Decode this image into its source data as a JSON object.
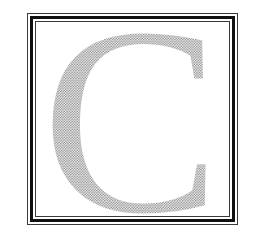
{
  "initial": {
    "letter": "C",
    "fill_style": "halftone-dots",
    "dot_color": "#8a8a8a",
    "background": "#ffffff"
  },
  "frame": {
    "style": "triple-line-border",
    "outer_line_color": "#3a3a3a",
    "thick_line_color": "#111111",
    "inner_line_color": "#3a3a3a"
  }
}
